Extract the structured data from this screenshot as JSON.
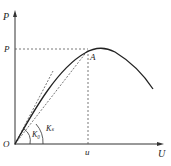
{
  "diagram": {
    "type": "load-displacement curve",
    "axis_labels": {
      "y": "P",
      "x": "U"
    },
    "origin_label": "O",
    "peak_load_label": "P",
    "peak_displacement_label": "u",
    "peak_point_label": "A",
    "stiffness_labels": {
      "initial": "K₀",
      "secant": "Kₛ"
    },
    "colors": {
      "line": "#222222",
      "dashed": "#555555"
    }
  }
}
